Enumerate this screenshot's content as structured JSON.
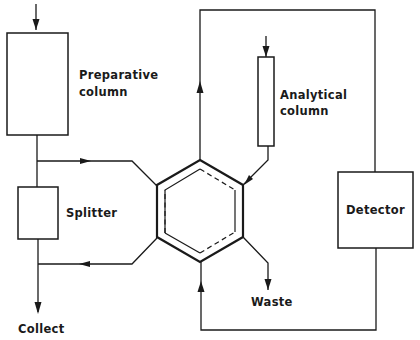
{
  "diagram": {
    "type": "hplc-column-switching-schematic",
    "labels": {
      "preparative_column_line1": "Preparative",
      "preparative_column_line2": "column",
      "analytical_column_line1": "Analytical",
      "analytical_column_line2": "column",
      "splitter": "Splitter",
      "detector": "Detector",
      "waste": "Waste",
      "collect": "Collect"
    },
    "components": [
      {
        "id": "preparative-column",
        "label": "Preparative column",
        "shape": "rectangle"
      },
      {
        "id": "splitter",
        "label": "Splitter",
        "shape": "rectangle"
      },
      {
        "id": "switching-valve",
        "label": "",
        "shape": "hexagon"
      },
      {
        "id": "analytical-column",
        "label": "Analytical column",
        "shape": "narrow-rectangle"
      },
      {
        "id": "detector",
        "label": "Detector",
        "shape": "rectangle"
      }
    ],
    "flows": [
      {
        "from": "inlet",
        "to": "preparative-column"
      },
      {
        "from": "preparative-column",
        "to": "switching-valve"
      },
      {
        "from": "preparative-column",
        "to": "splitter"
      },
      {
        "from": "switching-valve",
        "to": "splitter-outlet-line"
      },
      {
        "from": "splitter",
        "to": "collect"
      },
      {
        "from": "inlet",
        "to": "analytical-column"
      },
      {
        "from": "analytical-column",
        "to": "switching-valve"
      },
      {
        "from": "switching-valve",
        "to": "detector"
      },
      {
        "from": "detector",
        "to": "switching-valve"
      },
      {
        "from": "switching-valve",
        "to": "waste"
      }
    ]
  }
}
